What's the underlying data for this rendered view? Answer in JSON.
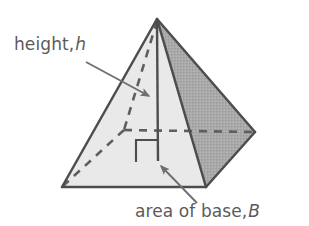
{
  "figure": {
    "type": "geometry-diagram",
    "background_color": "#ffffff"
  },
  "labels": {
    "height": {
      "text": "height,",
      "variable": "h",
      "full": "height, h",
      "color": "#5b5b5b"
    },
    "base": {
      "text": "area of base,",
      "variable": "B",
      "full": "area of base, B",
      "color": "#5b5b5b"
    }
  },
  "colors": {
    "outline": "#4d4d4d",
    "left_face": "#e9e9e9",
    "right_face": "#a9a9a9",
    "base_face": "#9c9c9c",
    "hidden_edge": "#6a6a6a",
    "height_line": "#4d4d4d",
    "leader_line": "#7a7a7a",
    "text": "#5b5b5b"
  },
  "geometry": {
    "apex": [
      157,
      19
    ],
    "front_left_corner": [
      62,
      187
    ],
    "front_right_corner": [
      206,
      187
    ],
    "right_corner": [
      255,
      132
    ],
    "hidden_back_corner": [
      124,
      130
    ],
    "base_center": [
      158,
      161
    ],
    "height_segment": [
      [
        157,
        19
      ],
      [
        158,
        161
      ]
    ],
    "right_angle_marker": [
      [
        137,
        161
      ],
      [
        137,
        140
      ],
      [
        158,
        140
      ]
    ]
  },
  "annotations": {
    "height_arrow": {
      "from": [
        86,
        62
      ],
      "to": [
        152,
        98
      ],
      "arrowhead": "filled-triangle"
    },
    "base_arrow": {
      "from": [
        197,
        203
      ],
      "to": [
        158,
        163
      ],
      "arrowhead": "filled-triangle"
    }
  }
}
